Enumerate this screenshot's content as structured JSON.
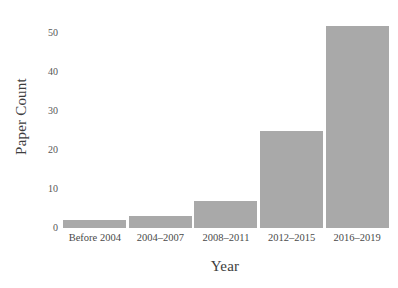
{
  "chart_data": {
    "type": "bar",
    "title": "",
    "xlabel": "Year",
    "ylabel": "Paper Count",
    "categories": [
      "Before 2004",
      "2004–2007",
      "2008–2011",
      "2012–2015",
      "2016–2019"
    ],
    "values": [
      2,
      3,
      7,
      25,
      52
    ],
    "ylim": [
      0,
      55
    ],
    "yticks": [
      0,
      10,
      20,
      30,
      40,
      50
    ],
    "ytick_labels": [
      "0",
      "10",
      "20",
      "30",
      "40",
      "50"
    ],
    "grid": false,
    "legend": null,
    "bar_color": "#a9a9a9",
    "background_color": "#ffffff",
    "text_color": "#4a4a4a"
  }
}
